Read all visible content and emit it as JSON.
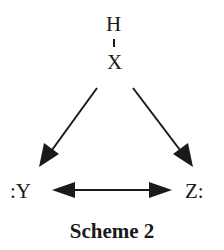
{
  "diagram": {
    "type": "reaction-scheme",
    "atoms": {
      "top_h": "H",
      "top_x": "X",
      "left": ":Y",
      "right": "Z:"
    },
    "bonds": [
      {
        "from": "H",
        "to": "X",
        "style": "single-bond-tick"
      }
    ],
    "arrows": [
      {
        "from": "HX",
        "to": ":Y",
        "style": "single-headed"
      },
      {
        "from": "HX",
        "to": "Z:",
        "style": "single-headed"
      },
      {
        "from": ":Y",
        "to": "Z:",
        "style": "double-headed"
      }
    ],
    "caption": "Scheme 2",
    "colors": {
      "ink": "#1a1a1a",
      "background": "#ffffff"
    }
  }
}
